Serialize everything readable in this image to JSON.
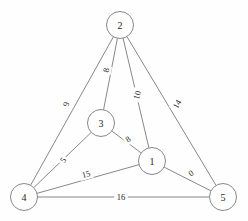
{
  "figure": {
    "kind": "weighted-undirected-graph",
    "background_color": "#fefefe",
    "stroke_color": "#7a7a7a",
    "text_color": "#1d1d1d"
  },
  "graph": {
    "nodes": [
      {
        "id": "2",
        "label": "2",
        "x": 120,
        "y": 25,
        "r": 13.5
      },
      {
        "id": "3",
        "label": "3",
        "x": 101,
        "y": 123,
        "r": 13.5
      },
      {
        "id": "1",
        "label": "1",
        "x": 152,
        "y": 161,
        "r": 13.5
      },
      {
        "id": "4",
        "label": "4",
        "x": 24,
        "y": 197,
        "r": 13.5
      },
      {
        "id": "5",
        "label": "5",
        "x": 223,
        "y": 197,
        "r": 13.5
      }
    ],
    "edges": [
      {
        "id": "e-2-4",
        "from": "2",
        "to": "4",
        "weight": "9",
        "lx": 66,
        "ly": 104,
        "rot": -79
      },
      {
        "id": "e-2-3",
        "from": "2",
        "to": "3",
        "weight": "8",
        "lx": 106,
        "ly": 70,
        "rot": -79
      },
      {
        "id": "e-2-1",
        "from": "2",
        "to": "1",
        "weight": "10",
        "lx": 137,
        "ly": 95,
        "rot": -75
      },
      {
        "id": "e-2-5",
        "from": "2",
        "to": "5",
        "weight": "14",
        "lx": 177,
        "ly": 104,
        "rot": -60
      },
      {
        "id": "e-3-1",
        "from": "3",
        "to": "1",
        "weight": "8",
        "lx": 128,
        "ly": 139,
        "rot": -37
      },
      {
        "id": "e-3-4",
        "from": "3",
        "to": "4",
        "weight": "5",
        "lx": 63,
        "ly": 160,
        "rot": -55
      },
      {
        "id": "e-4-1",
        "from": "4",
        "to": "1",
        "weight": "15",
        "lx": 86,
        "ly": 174,
        "rot": -15
      },
      {
        "id": "e-1-5",
        "from": "1",
        "to": "5",
        "weight": "0",
        "lx": 191,
        "ly": 173,
        "rot": -37
      },
      {
        "id": "e-4-5",
        "from": "4",
        "to": "5",
        "weight": "16",
        "lx": 121,
        "ly": 197,
        "rot": 0
      }
    ]
  }
}
